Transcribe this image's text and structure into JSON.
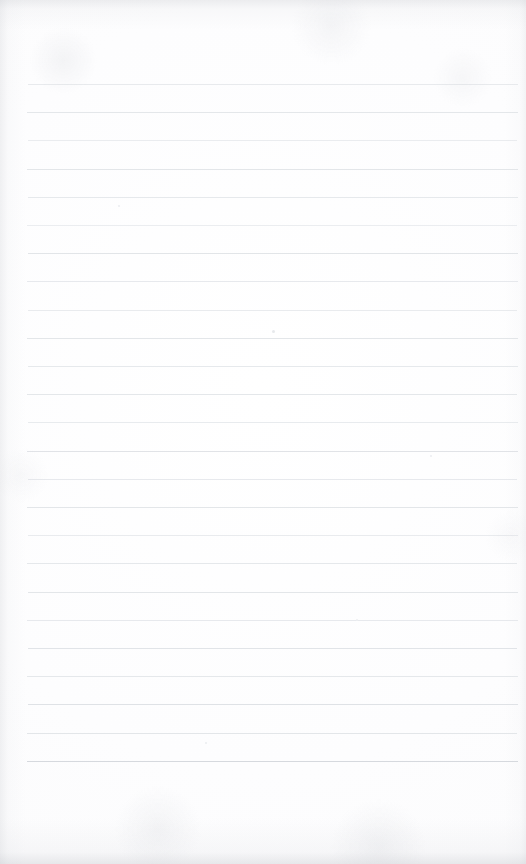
{
  "document": {
    "kind": "lined-paper-scan",
    "description": "Blank ruled notebook paper, scanned",
    "width": 526,
    "height": 864,
    "has_text": false,
    "has_handwriting": false,
    "has_vertical_margin_rule": false
  },
  "paper": {
    "background_color": "#fdfdfd",
    "grain_color": "#d0d2d7",
    "edge_shadow_color": "#c4c6cb"
  },
  "ruling": {
    "line_color": "#e0e3e7",
    "line_count": 25,
    "first_line_y": 84,
    "last_line_y": 761,
    "line_spacing": 28.2,
    "left_margin_x": 27,
    "right_edge_x": 518,
    "line_thickness": 1,
    "lines": [
      {
        "y": 84,
        "x1": 28,
        "x2": 518,
        "color": "#e2e5e9",
        "opacity": 0.8
      },
      {
        "y": 112,
        "x1": 27,
        "x2": 518,
        "color": "#e0e3e7",
        "opacity": 0.86
      },
      {
        "y": 140,
        "x1": 28,
        "x2": 517,
        "color": "#e3e6ea",
        "opacity": 0.74
      },
      {
        "y": 169,
        "x1": 27,
        "x2": 518,
        "color": "#dfe2e6",
        "opacity": 0.88
      },
      {
        "y": 197,
        "x1": 28,
        "x2": 518,
        "color": "#e1e4e8",
        "opacity": 0.82
      },
      {
        "y": 225,
        "x1": 27,
        "x2": 517,
        "color": "#e3e6ea",
        "opacity": 0.72
      },
      {
        "y": 253,
        "x1": 28,
        "x2": 518,
        "color": "#dfe2e6",
        "opacity": 0.9
      },
      {
        "y": 281,
        "x1": 27,
        "x2": 518,
        "color": "#e1e4e8",
        "opacity": 0.8
      },
      {
        "y": 310,
        "x1": 28,
        "x2": 517,
        "color": "#e2e5e9",
        "opacity": 0.76
      },
      {
        "y": 338,
        "x1": 27,
        "x2": 518,
        "color": "#dfe2e6",
        "opacity": 0.88
      },
      {
        "y": 366,
        "x1": 28,
        "x2": 518,
        "color": "#e1e4e8",
        "opacity": 0.82
      },
      {
        "y": 394,
        "x1": 27,
        "x2": 517,
        "color": "#e0e3e7",
        "opacity": 0.86
      },
      {
        "y": 422,
        "x1": 28,
        "x2": 518,
        "color": "#e2e5e9",
        "opacity": 0.78
      },
      {
        "y": 451,
        "x1": 27,
        "x2": 518,
        "color": "#dee1e5",
        "opacity": 0.92
      },
      {
        "y": 479,
        "x1": 28,
        "x2": 517,
        "color": "#e1e4e8",
        "opacity": 0.8
      },
      {
        "y": 507,
        "x1": 27,
        "x2": 518,
        "color": "#dfe2e6",
        "opacity": 0.88
      },
      {
        "y": 535,
        "x1": 28,
        "x2": 518,
        "color": "#e2e5e9",
        "opacity": 0.76
      },
      {
        "y": 563,
        "x1": 27,
        "x2": 517,
        "color": "#e0e3e7",
        "opacity": 0.84
      },
      {
        "y": 592,
        "x1": 28,
        "x2": 518,
        "color": "#dfe2e6",
        "opacity": 0.88
      },
      {
        "y": 620,
        "x1": 27,
        "x2": 518,
        "color": "#e1e4e8",
        "opacity": 0.8
      },
      {
        "y": 648,
        "x1": 28,
        "x2": 517,
        "color": "#dee1e5",
        "opacity": 0.9
      },
      {
        "y": 676,
        "x1": 27,
        "x2": 518,
        "color": "#e0e3e7",
        "opacity": 0.84
      },
      {
        "y": 704,
        "x1": 28,
        "x2": 518,
        "color": "#dde0e4",
        "opacity": 0.94
      },
      {
        "y": 733,
        "x1": 27,
        "x2": 517,
        "color": "#dfe2e6",
        "opacity": 0.88
      },
      {
        "y": 761,
        "x1": 27,
        "x2": 518,
        "color": "#d6d9de",
        "opacity": 1.0
      }
    ]
  },
  "specks": [
    {
      "x": 272,
      "y": 330,
      "size": 3,
      "color": "#e7e9ec"
    },
    {
      "x": 205,
      "y": 742,
      "size": 2,
      "color": "#eaecef"
    },
    {
      "x": 118,
      "y": 205,
      "size": 2,
      "color": "#ebedf0"
    },
    {
      "x": 430,
      "y": 455,
      "size": 2,
      "color": "#ebedf0"
    },
    {
      "x": 356,
      "y": 619,
      "size": 2,
      "color": "#eceef1"
    }
  ]
}
